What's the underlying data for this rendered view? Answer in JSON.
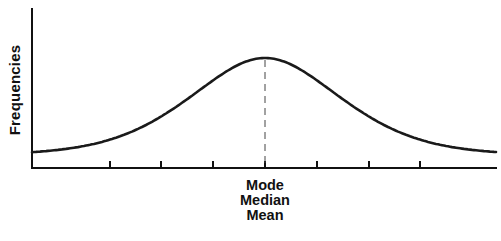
{
  "chart_data": {
    "type": "line",
    "title": "",
    "xlabel": "",
    "ylabel": "Frequencies",
    "x_ticks_count": 7,
    "x_tick_labels": [
      "",
      "",
      "",
      "Mode / Median / Mean",
      "",
      "",
      ""
    ],
    "center_annotation": [
      "Mode",
      "Median",
      "Mean"
    ],
    "series": [
      {
        "name": "distribution",
        "x": [
          -4.5,
          -3,
          -2,
          -1,
          0,
          1,
          2,
          3,
          4.5
        ],
        "values": [
          0.09,
          0.18,
          0.32,
          0.62,
          1.0,
          0.62,
          0.32,
          0.18,
          0.09
        ]
      }
    ],
    "dashed_center_line": true,
    "grid": false,
    "legend": "none",
    "ylim": [
      0,
      1.1
    ]
  },
  "axes": {
    "y_label": "Frequencies"
  },
  "annotation": {
    "line1": "Mode",
    "line2": "Median",
    "line3": "Mean"
  },
  "colors": {
    "line": "#1a1a1a",
    "axis": "#111111",
    "background": "#ffffff"
  }
}
